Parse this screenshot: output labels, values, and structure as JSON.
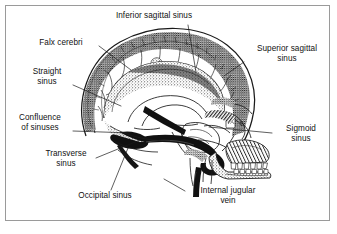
{
  "figure": {
    "background_color": "#ffffff",
    "frame_color": "#9a9a9a",
    "ink_color": "#111111",
    "style": "black-and-white engraved line drawing with stipple shading"
  },
  "labels": [
    {
      "id": "inferior-sagittal-sinus",
      "text": "Inferior sagittal sinus",
      "align": "center"
    },
    {
      "id": "falx-cerebri",
      "text": "Falx cerebri",
      "align": "center"
    },
    {
      "id": "superior-sagittal-sinus",
      "text": "Superior sagittal\nsinus",
      "align": "center"
    },
    {
      "id": "straight-sinus",
      "text": "Straight\nsinus",
      "align": "center"
    },
    {
      "id": "confluence-of-sinuses",
      "text": "Confluence\nof sinuses",
      "align": "center"
    },
    {
      "id": "sigmoid-sinus",
      "text": "Sigmoid\nsinus",
      "align": "center"
    },
    {
      "id": "transverse-sinus",
      "text": "Transverse\nsinus",
      "align": "center"
    },
    {
      "id": "occipital-sinus",
      "text": "Occipital sinus",
      "align": "center"
    },
    {
      "id": "internal-jugular-vein",
      "text": "Internal jugular\nvein",
      "align": "center"
    }
  ],
  "anatomy_parts": [
    "cranial vault",
    "superior sagittal sinus band",
    "falx cerebri",
    "emissary veins",
    "cerebellum",
    "confluence of sinuses",
    "transverse sinus",
    "sigmoid sinus",
    "occipital sinus",
    "internal jugular vein",
    "maxilla and teeth",
    "mandible",
    "facial skeleton"
  ]
}
